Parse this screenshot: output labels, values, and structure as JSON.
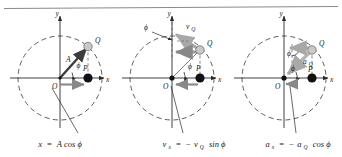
{
  "figure": {
    "title": "",
    "top_rule": true,
    "background": "#ffffff",
    "ink": "#1a1a1a",
    "vector_dark": "#3c3c3c",
    "vector_light": "#b0b0b0",
    "point_q_fill": "#c9c9c9",
    "point_p_fill": "#111111",
    "dash_color": "#4a4a4a"
  },
  "panels": [
    {
      "id": "panel-displacement",
      "axis_x_label": "x",
      "axis_y_label": "y",
      "origin_label": "O",
      "point_p_label": "P",
      "point_q_label": "Q",
      "angle_label": "ϕ",
      "vector_labels": [
        "A"
      ],
      "caption": "x = A cos ϕ",
      "caption_parts": {
        "lhs": "x",
        "equals": "=",
        "rhs": "A cos ϕ"
      }
    },
    {
      "id": "panel-velocity",
      "axis_x_label": "x",
      "axis_y_label": "y",
      "origin_label": "O",
      "point_p_label": "P",
      "point_q_label": "Q",
      "angle_label": "ϕ",
      "angle_label_2": "ϕ",
      "vector_labels": [
        "v",
        "Q"
      ],
      "vector_main_label": "v",
      "vector_main_sub": "Q",
      "caption": "vₓ = −v_Q sin ϕ",
      "caption_parts": {
        "lhs_base": "v",
        "lhs_sub": "x",
        "equals": "=",
        "rhs_sign": "−",
        "rhs_base": "v",
        "rhs_sub": "Q",
        "rhs_fn": "sin ϕ"
      }
    },
    {
      "id": "panel-acceleration",
      "axis_x_label": "x",
      "axis_y_label": "y",
      "origin_label": "O",
      "point_p_label": "P",
      "point_q_label": "Q",
      "angle_label": "ϕ",
      "angle_label_2": "ϕ",
      "vector_main_label": "a",
      "vector_main_sub": "Q",
      "caption": "aₓ = −a_Q cos ϕ",
      "caption_parts": {
        "lhs_base": "a",
        "lhs_sub": "x",
        "equals": "=",
        "rhs_sign": "−",
        "rhs_base": "a",
        "rhs_sub": "Q",
        "rhs_fn": "cos ϕ"
      }
    }
  ]
}
